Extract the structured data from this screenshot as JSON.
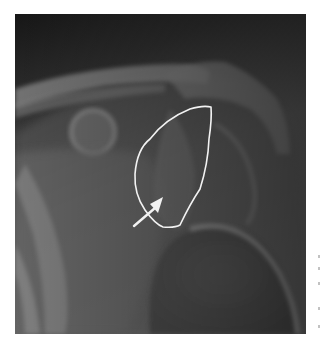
{
  "image": {
    "subject": "shoulder radiograph",
    "description": "Anteroposterior shoulder X-ray with a hand-drawn white outline around a region near the glenoid and a white arrow pointing into it",
    "annotations": {
      "outline": {
        "color": "#f2f2f2",
        "shape": "freehand-loop"
      },
      "arrow": {
        "color": "#f2f2f2",
        "direction": "up-right"
      }
    },
    "colors": {
      "background_dark": "#1c1c1c",
      "bone_light": "#9c9c9c",
      "soft_tissue": "#6a6a6a",
      "page": "#ffffff"
    }
  }
}
